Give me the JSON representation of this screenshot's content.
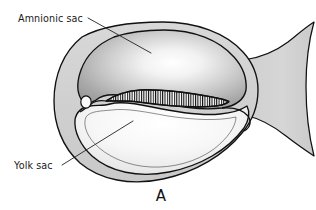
{
  "figure": {
    "title_letter": "A",
    "background_color": "#ffffff",
    "line_color": "#111111",
    "labels": [
      {
        "id": "amnionic-sac",
        "text": "Amnionic sac",
        "text_x": 18,
        "text_y": 22,
        "leader_from_x": 88,
        "leader_from_y": 18,
        "leader_to_x": 151,
        "leader_to_y": 53
      },
      {
        "id": "yolk-sac",
        "text": "Yolk sac",
        "text_x": 14,
        "text_y": 169,
        "leader_from_x": 62,
        "leader_from_y": 165,
        "leader_to_x": 133,
        "leader_to_y": 121
      }
    ],
    "structures": [
      {
        "id": "chorion-outer-membrane",
        "name": "chorion / outer membrane",
        "fill_color": "#d2d2d2"
      },
      {
        "id": "body-stalk",
        "name": "body stalk flare",
        "fill_color": "#d2d2d2"
      },
      {
        "id": "amnionic-sac-cavity",
        "name": "amnionic sac cavity",
        "fill_light": "#ffffff",
        "fill_mid": "#b6b6b6",
        "fill_dark": "#8e8e8e"
      },
      {
        "id": "yolk-sac-cavity",
        "name": "yolk sac cavity",
        "fill_light": "#ffffff",
        "fill_mid": "#eeeeee",
        "fill_dark": "#d6d6d6"
      },
      {
        "id": "embryonic-disc",
        "name": "embryonic germ disc (hatched band)",
        "fill_color": "#ffffff",
        "hatch_color": "#101010",
        "hatch_count": 46
      },
      {
        "id": "vesicle",
        "name": "small vesicle",
        "fill_color": "#fbfbfb",
        "cx": 86,
        "cy": 102,
        "rx": 5.2,
        "ry": 6.0
      }
    ]
  }
}
